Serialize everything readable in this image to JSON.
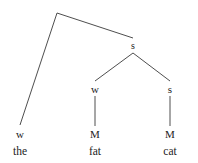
{
  "figure": {
    "kind": "metrical-tree-diagram",
    "background_color": "#ffffff",
    "line_color": "#3a3a3a",
    "text_color": "#1c1c1c",
    "width": 198,
    "height": 163,
    "phrase": "the fat cat"
  },
  "nodes": {
    "root": {
      "label": "",
      "x": 57,
      "y": 13
    },
    "branch_s": {
      "label": "s",
      "x": 133,
      "y": 46
    },
    "the_w": {
      "label": "w",
      "x": 20,
      "y": 134
    },
    "fat_w": {
      "label": "w",
      "x": 95,
      "y": 89
    },
    "cat_s": {
      "label": "s",
      "x": 170,
      "y": 89
    },
    "fat_m": {
      "label": "M",
      "x": 95,
      "y": 134
    },
    "cat_m": {
      "label": "M",
      "x": 170,
      "y": 134
    }
  },
  "words": {
    "the": {
      "text": "the",
      "x": 20,
      "y": 152
    },
    "fat": {
      "text": "fat",
      "x": 95,
      "y": 152
    },
    "cat": {
      "text": "cat",
      "x": 170,
      "y": 152
    }
  },
  "edges": [
    {
      "name": "root-to-the",
      "from": "root",
      "to": "the_w",
      "x1": 57,
      "y1": 13,
      "x2": 20,
      "y2": 125
    },
    {
      "name": "root-to-branch-s",
      "from": "root",
      "to": "branch_s",
      "x1": 57,
      "y1": 13,
      "x2": 133,
      "y2": 38
    },
    {
      "name": "branch-s-to-fat-w",
      "from": "branch_s",
      "to": "fat_w",
      "x1": 133,
      "y1": 53,
      "x2": 95,
      "y2": 81
    },
    {
      "name": "branch-s-to-cat-s",
      "from": "branch_s",
      "to": "cat_s",
      "x1": 133,
      "y1": 53,
      "x2": 170,
      "y2": 81
    },
    {
      "name": "fat-w-to-fat-m",
      "from": "fat_w",
      "to": "fat_m",
      "x1": 95,
      "y1": 96,
      "x2": 95,
      "y2": 126
    },
    {
      "name": "cat-s-to-cat-m",
      "from": "cat_s",
      "to": "cat_m",
      "x1": 170,
      "y1": 96,
      "x2": 170,
      "y2": 126
    }
  ]
}
